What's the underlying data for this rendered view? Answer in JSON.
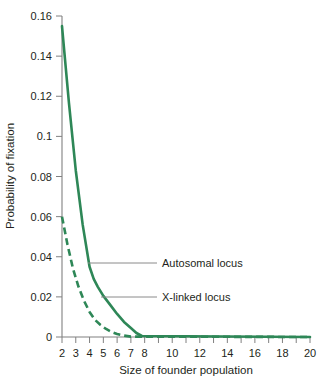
{
  "chart_data": {
    "type": "line",
    "title": "",
    "xlabel": "Size of founder population",
    "ylabel": "Probability of fixation",
    "xlim": [
      2,
      20
    ],
    "ylim": [
      0,
      0.16
    ],
    "grid": false,
    "legend_position": "inline-annotations",
    "x_tick_values": [
      2,
      3,
      4,
      5,
      6,
      7,
      8,
      9,
      10,
      11,
      12,
      13,
      14,
      15,
      16,
      17,
      18,
      19,
      20
    ],
    "x_tick_labels": [
      "2",
      "3",
      "4",
      "5",
      "6",
      "7",
      "8",
      "",
      "10",
      "",
      "12",
      "",
      "14",
      "",
      "16",
      "",
      "18",
      "",
      "20"
    ],
    "y_tick_values": [
      0,
      0.02,
      0.04,
      0.06,
      0.08,
      0.1,
      0.12,
      0.14,
      0.16
    ],
    "y_tick_labels": [
      "0",
      "0.02",
      "0.04",
      "0.06",
      "0.08",
      "0.1",
      "0.12",
      "0.14",
      "0.16"
    ],
    "line_color": "#2e8757",
    "series": [
      {
        "name": "Autosomal locus",
        "style": "solid",
        "x": [
          2,
          2.5,
          3,
          3.5,
          4,
          4.3,
          4.6,
          5,
          5.5,
          6,
          6.5,
          7,
          7.4,
          7.8,
          20
        ],
        "values": [
          0.155,
          0.117,
          0.083,
          0.056,
          0.035,
          0.029,
          0.025,
          0.0205,
          0.016,
          0.0115,
          0.0075,
          0.0045,
          0.002,
          0.0005,
          0
        ]
      },
      {
        "name": "X-linked locus",
        "style": "dashed",
        "x": [
          2,
          2.4,
          2.8,
          3.2,
          3.6,
          4,
          4.4,
          4.8,
          5.2,
          5.6,
          6,
          6.5,
          7,
          20
        ],
        "values": [
          0.06,
          0.046,
          0.034,
          0.025,
          0.018,
          0.0125,
          0.0085,
          0.006,
          0.004,
          0.0025,
          0.0015,
          0.0007,
          0.0002,
          0
        ]
      }
    ],
    "annotations": [
      {
        "name": "Autosomal locus",
        "leader_color": "#808080"
      },
      {
        "name": "X-linked locus",
        "leader_color": "#808080"
      }
    ]
  }
}
